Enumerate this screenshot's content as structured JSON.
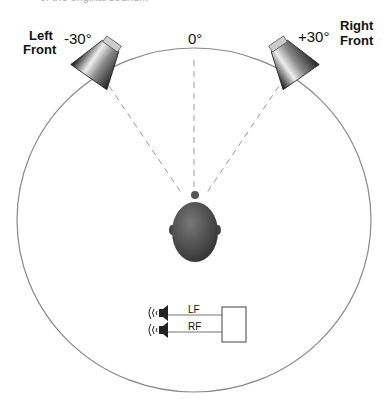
{
  "caption_fragment": "of the original sound...",
  "diagram": {
    "center_angle": "0°",
    "left_speaker": {
      "name_line1": "Left",
      "name_line2": "Front",
      "angle": "-30°"
    },
    "right_speaker": {
      "name_line1": "Right",
      "name_line2": "Front",
      "angle": "+30°"
    },
    "listener": "listener-head",
    "schematic": {
      "channels": [
        {
          "label": "LF"
        },
        {
          "label": "RF"
        }
      ]
    },
    "colors": {
      "circle": "#888888",
      "dashes": "#999999",
      "head": "#555555",
      "text": "#111111"
    }
  }
}
